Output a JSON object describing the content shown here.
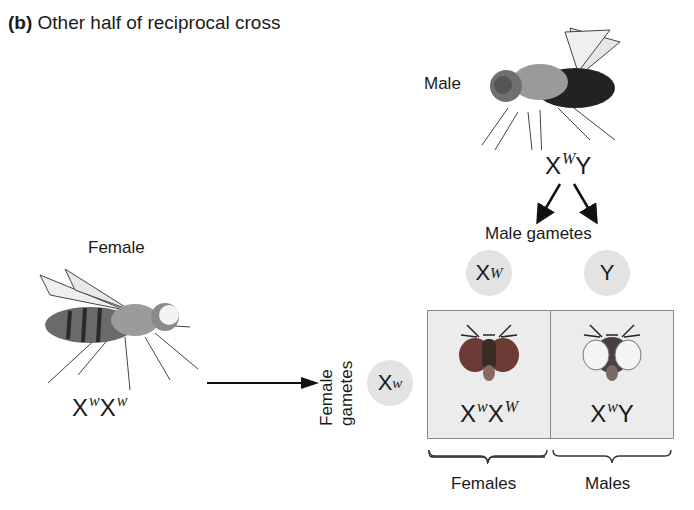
{
  "title": {
    "prefix": "(b)",
    "text": "Other half of reciprocal cross"
  },
  "male": {
    "label": "Male",
    "genotype": {
      "base1": "X",
      "allele1": "W",
      "base2": "Y"
    }
  },
  "female": {
    "label": "Female",
    "genotype": {
      "base1": "X",
      "allele1": "w",
      "base2": "X",
      "allele2": "w"
    }
  },
  "male_gametes": {
    "label": "Male gametes",
    "items": [
      {
        "base": "X",
        "allele": "W"
      },
      {
        "base": "Y",
        "allele": ""
      }
    ]
  },
  "female_gametes": {
    "label_line1": "Female",
    "label_line2": "gametes",
    "items": [
      {
        "base": "X",
        "allele": "w"
      }
    ]
  },
  "punnett": {
    "cells": [
      {
        "base1": "X",
        "allele1": "w",
        "base2": "X",
        "allele2": "W",
        "eye_color": "red",
        "phenotype": "red-eyed"
      },
      {
        "base1": "X",
        "allele1": "w",
        "base2": "Y",
        "allele2": "",
        "eye_color": "white",
        "phenotype": "white-eyed"
      }
    ]
  },
  "offspring_labels": {
    "left": "Females",
    "right": "Males"
  },
  "colors": {
    "gamete_circle": "#e3e3e3",
    "punnett_bg": "#ececec",
    "red_eye": "#8a3a32",
    "white_eye": "#f4f4f4"
  }
}
